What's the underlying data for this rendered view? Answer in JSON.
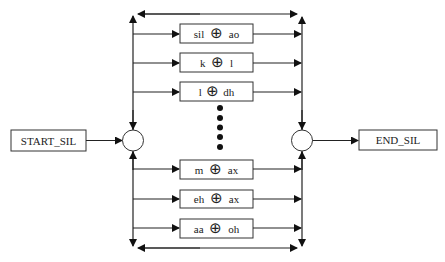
{
  "diagram": {
    "start_node": {
      "label": "START_SIL"
    },
    "end_node": {
      "label": "END_SIL"
    },
    "operator_symbol": "⊕",
    "top_boxes": [
      {
        "left": "sil",
        "right": "ao"
      },
      {
        "left": "k",
        "right": "l"
      },
      {
        "left": "l",
        "right": "dh"
      }
    ],
    "bottom_boxes": [
      {
        "left": "m",
        "right": "ax"
      },
      {
        "left": "eh",
        "right": "ax"
      },
      {
        "left": "aa",
        "right": "oh"
      }
    ],
    "ellipsis": {
      "dot_count": 5
    }
  }
}
